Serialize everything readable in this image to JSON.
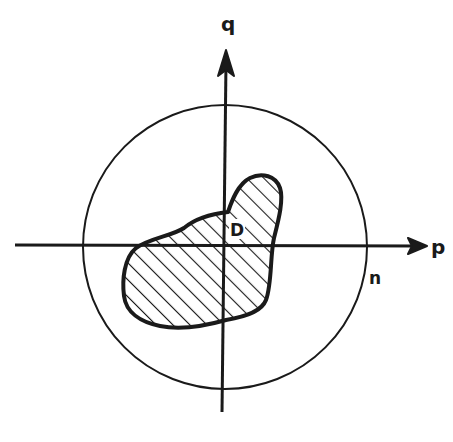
{
  "diagram": {
    "axes": {
      "horizontal": {
        "label": "p"
      },
      "vertical": {
        "label": "q"
      }
    },
    "circle": {
      "label": "n"
    },
    "region": {
      "label": "D",
      "fill": "hatched"
    },
    "colors": {
      "ink": "#1a1a1a",
      "background": "#ffffff"
    }
  }
}
